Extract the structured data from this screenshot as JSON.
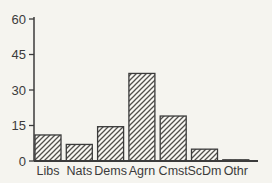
{
  "figure": {
    "background": "#f5f4ef",
    "ink_color": "#3b3b3b",
    "hatch_color": "#52504c",
    "bar_fill": "#f8f7f3"
  },
  "chart_data": {
    "type": "bar",
    "title": "",
    "xlabel": "",
    "ylabel": "",
    "categories": [
      "Libs",
      "Nats",
      "Dems",
      "Agrn",
      "Cmst",
      "ScDm",
      "Othr"
    ],
    "values": [
      11,
      7,
      14.5,
      37,
      19,
      5,
      0.5
    ],
    "ylim": [
      0,
      60
    ],
    "yticks": [
      0,
      15,
      30,
      45,
      60
    ],
    "grid": false,
    "legend": "none",
    "bar_style": "diagonal-hatch"
  }
}
